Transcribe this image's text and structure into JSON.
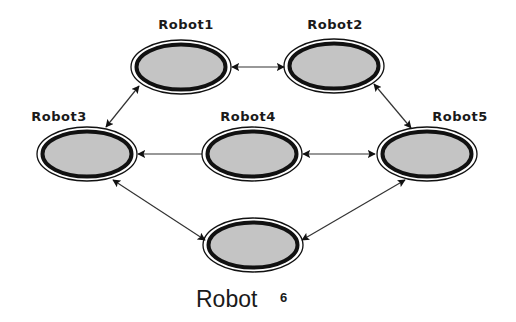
{
  "diagram": {
    "type": "robot-network",
    "colors": {
      "node_fill": "#c4c4c4",
      "node_ring": "#111111",
      "edge": "#333333",
      "background": "#ffffff"
    },
    "nodes": [
      {
        "id": "robot1",
        "label": "Robot1",
        "cx": 181,
        "cy": 67,
        "label_x": 186,
        "label_y": 29
      },
      {
        "id": "robot2",
        "label": "Robot2",
        "cx": 334,
        "cy": 66,
        "label_x": 335,
        "label_y": 29
      },
      {
        "id": "robot3",
        "label": "Robot3",
        "cx": 87,
        "cy": 154,
        "label_x": 59,
        "label_y": 121
      },
      {
        "id": "robot4",
        "label": "Robot4",
        "cx": 252,
        "cy": 154,
        "label_x": 248,
        "label_y": 121
      },
      {
        "id": "robot5",
        "label": "Robot5",
        "cx": 427,
        "cy": 154,
        "label_x": 460,
        "label_y": 121
      },
      {
        "id": "robot6",
        "label": "",
        "cx": 253,
        "cy": 245
      }
    ],
    "edges": [
      {
        "from": "robot1",
        "to": "robot2",
        "arrows": "both"
      },
      {
        "from": "robot1",
        "to": "robot3",
        "arrows": "both"
      },
      {
        "from": "robot2",
        "to": "robot5",
        "arrows": "both"
      },
      {
        "from": "robot4",
        "to": "robot3",
        "arrows": "end"
      },
      {
        "from": "robot4",
        "to": "robot5",
        "arrows": "both"
      },
      {
        "from": "robot3",
        "to": "robot6",
        "arrows": "both"
      },
      {
        "from": "robot5",
        "to": "robot6",
        "arrows": "both"
      }
    ],
    "caption": {
      "text": "Robot",
      "number": "6"
    }
  },
  "labels": {
    "robot1": "Robot1",
    "robot2": "Robot2",
    "robot3": "Robot3",
    "robot4": "Robot4",
    "robot5": "Robot5"
  }
}
